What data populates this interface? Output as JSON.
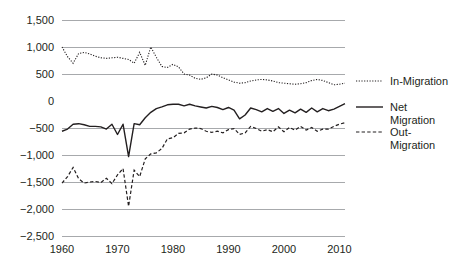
{
  "chart_data": {
    "type": "line",
    "title": "",
    "xlabel": "",
    "ylabel": "",
    "xlim": [
      1960,
      2011
    ],
    "ylim": [
      -2500,
      1500
    ],
    "grid": true,
    "grid_axis": "y",
    "legend_position": "right",
    "y_ticks": [
      "1,500",
      "1,000",
      "500",
      "0",
      "-500",
      "-1,000",
      "-1,500",
      "-2,000",
      "-2,500"
    ],
    "y_tick_values": [
      1500,
      1000,
      500,
      0,
      -500,
      -1000,
      -1500,
      -2000,
      -2500
    ],
    "gridline_values": [
      1500,
      1000,
      500,
      -500,
      -1000,
      -1500,
      -2000,
      -2500
    ],
    "x_ticks": [
      "1960",
      "1970",
      "1980",
      "1990",
      "2000",
      "2010"
    ],
    "x_tick_values": [
      1960,
      1970,
      1980,
      1990,
      2000,
      2010
    ],
    "x": [
      1960,
      1961,
      1962,
      1963,
      1964,
      1965,
      1966,
      1967,
      1968,
      1969,
      1970,
      1971,
      1972,
      1973,
      1974,
      1975,
      1976,
      1977,
      1978,
      1979,
      1980,
      1981,
      1982,
      1983,
      1984,
      1985,
      1986,
      1987,
      1988,
      1989,
      1990,
      1991,
      1992,
      1993,
      1994,
      1995,
      1996,
      1997,
      1998,
      1999,
      2000,
      2001,
      2002,
      2003,
      2004,
      2005,
      2006,
      2007,
      2008,
      2009,
      2010,
      2011
    ],
    "series": [
      {
        "name": "In-Migration",
        "style": "dotted",
        "color": "#231f20",
        "values": [
          1000,
          820,
          700,
          880,
          900,
          870,
          830,
          800,
          790,
          800,
          810,
          790,
          770,
          700,
          900,
          660,
          1000,
          810,
          640,
          620,
          680,
          630,
          500,
          480,
          420,
          400,
          430,
          500,
          480,
          430,
          390,
          350,
          330,
          340,
          370,
          390,
          400,
          390,
          370,
          340,
          330,
          320,
          310,
          320,
          340,
          380,
          400,
          380,
          340,
          300,
          310,
          330
        ]
      },
      {
        "name": "Net Migration",
        "style": "solid",
        "color": "#231f20",
        "values": [
          -560,
          -520,
          -430,
          -420,
          -440,
          -470,
          -470,
          -480,
          -520,
          -430,
          -620,
          -430,
          -1030,
          -420,
          -440,
          -310,
          -210,
          -140,
          -110,
          -70,
          -60,
          -60,
          -90,
          -60,
          -90,
          -110,
          -130,
          -100,
          -120,
          -160,
          -120,
          -170,
          -330,
          -260,
          -130,
          -160,
          -200,
          -140,
          -190,
          -140,
          -230,
          -170,
          -220,
          -150,
          -210,
          -130,
          -200,
          -140,
          -180,
          -150,
          -100,
          -50
        ]
      },
      {
        "name": "Out-Migration",
        "style": "dashed",
        "color": "#231f20",
        "values": [
          -1520,
          -1400,
          -1230,
          -1440,
          -1520,
          -1500,
          -1490,
          -1510,
          -1430,
          -1530,
          -1370,
          -1250,
          -1950,
          -1280,
          -1400,
          -1070,
          -980,
          -960,
          -880,
          -700,
          -680,
          -600,
          -590,
          -520,
          -500,
          -510,
          -560,
          -580,
          -560,
          -590,
          -530,
          -510,
          -620,
          -590,
          -470,
          -510,
          -560,
          -530,
          -570,
          -480,
          -570,
          -490,
          -540,
          -470,
          -540,
          -490,
          -560,
          -520,
          -520,
          -470,
          -430,
          -400
        ]
      }
    ]
  },
  "legend": {
    "items": [
      {
        "label": "In-Migration",
        "style": "dotted"
      },
      {
        "label": "Net Migration",
        "style": "solid"
      },
      {
        "label": "Out-Migration",
        "style": "dashed"
      }
    ],
    "net_line1": "Net",
    "net_line2": "Migration",
    "out_line1": "Out-",
    "out_line2": "Migration",
    "in_line1": "In-Migration"
  },
  "colors": {
    "ink": "#231f20",
    "gridline": "#a7a9ac",
    "background": "#ffffff"
  }
}
